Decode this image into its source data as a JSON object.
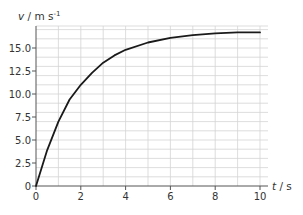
{
  "chart_data": {
    "type": "line",
    "title": "",
    "xlabel": "t / s",
    "ylabel": "v / m s⁻¹",
    "xlim": [
      0,
      10
    ],
    "ylim": [
      0,
      17.4
    ],
    "grid": true,
    "x_ticks": [
      0,
      2,
      4,
      6,
      8,
      10
    ],
    "x_tick_labels": [
      "0",
      "2",
      "4",
      "6",
      "8",
      "10"
    ],
    "y_ticks": [
      0,
      2.5,
      5.0,
      7.5,
      10.0,
      12.5,
      15.0
    ],
    "y_tick_labels": [
      "0",
      "2.5",
      "5.0",
      "7.5",
      "10.0",
      "12.5",
      "15.0"
    ],
    "legend": null,
    "series": [
      {
        "name": "velocity",
        "color": "#1a1a1a",
        "x": [
          0,
          0.5,
          1,
          1.5,
          2,
          2.5,
          3,
          3.5,
          4,
          5,
          6,
          7,
          8,
          9,
          10
        ],
        "y": [
          0,
          3.9,
          7.0,
          9.4,
          11.0,
          12.3,
          13.4,
          14.2,
          14.8,
          15.6,
          16.1,
          16.4,
          16.6,
          16.7,
          16.7
        ]
      }
    ]
  },
  "labels": {
    "y_axis_v": "v",
    "y_axis_unit": " / m s",
    "y_axis_exp": "-1",
    "x_axis_t": "t",
    "x_axis_unit": " / s"
  }
}
